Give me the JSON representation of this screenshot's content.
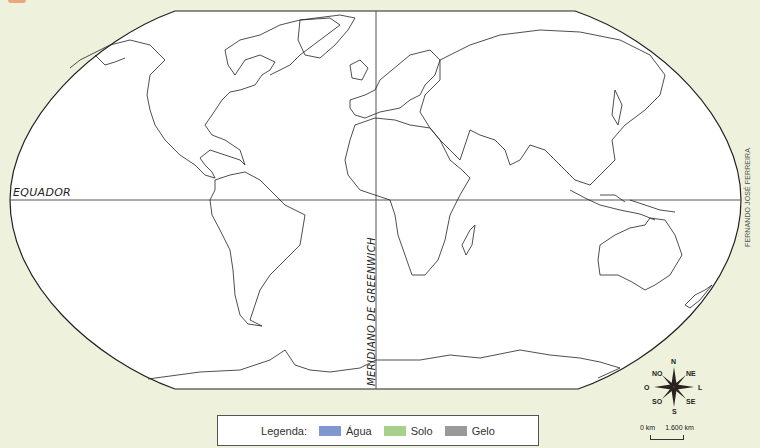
{
  "map": {
    "title_marker_color": "#e9a77f",
    "background_color": "#eef2dc",
    "ocean_color": "#ffffff",
    "equator_label": "EQUADOR",
    "meridian_label": "MERIDIANO DE GREENWICH",
    "credit": "FERNANDO JOSÉ FERREIRA"
  },
  "legend": {
    "title": "Legenda:",
    "items": [
      {
        "label": "Água",
        "color": "#7f98cf"
      },
      {
        "label": "Solo",
        "color": "#a7d08c"
      },
      {
        "label": "Gelo",
        "color": "#9a9a9a"
      }
    ]
  },
  "compass": {
    "n": "N",
    "ne": "NE",
    "l": "L",
    "se": "SE",
    "s": "S",
    "so": "SO",
    "o": "O",
    "no": "NO"
  },
  "scale": {
    "start": "0 km",
    "end": "1.600 km"
  }
}
